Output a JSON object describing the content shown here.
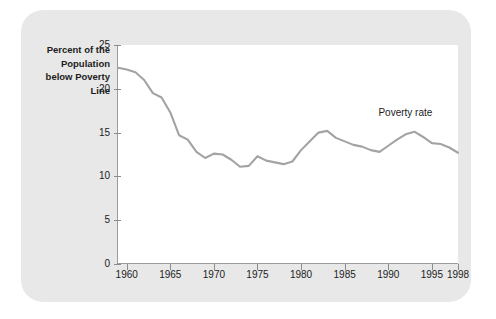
{
  "chart_data": {
    "type": "line",
    "title": "",
    "xlabel": "",
    "ylabel": "Percent of the\nPopulation\nbelow Poverty\nLine",
    "xlim": [
      1959,
      1998
    ],
    "ylim": [
      0,
      25
    ],
    "grid": false,
    "legend_position": "inline-annotation",
    "line_color": "#a3a3a3",
    "panel_color": "#ffffff",
    "card_color": "#e8e8e8",
    "yticks": [
      0,
      5,
      10,
      15,
      20,
      25
    ],
    "ytick_labels": [
      "0",
      "5",
      "10",
      "15",
      "20",
      "25"
    ],
    "xticks": [
      1960,
      1965,
      1970,
      1975,
      1980,
      1985,
      1990,
      1995,
      1998
    ],
    "xtick_labels": [
      "1960",
      "1965",
      "1970",
      "1975",
      "1980",
      "1985",
      "1990",
      "1995",
      "1998"
    ],
    "annotations": [
      {
        "text": "Poverty rate",
        "x": 1993,
        "y": 17.2
      }
    ],
    "series": [
      {
        "name": "Poverty rate",
        "x": [
          1959,
          1960,
          1961,
          1962,
          1963,
          1964,
          1965,
          1966,
          1967,
          1968,
          1969,
          1970,
          1971,
          1972,
          1973,
          1974,
          1975,
          1976,
          1977,
          1978,
          1979,
          1980,
          1981,
          1982,
          1983,
          1984,
          1985,
          1986,
          1987,
          1988,
          1989,
          1990,
          1991,
          1992,
          1993,
          1994,
          1995,
          1996,
          1997,
          1998
        ],
        "values": [
          22.4,
          22.2,
          21.9,
          21.0,
          19.5,
          19.0,
          17.3,
          14.7,
          14.2,
          12.8,
          12.1,
          12.6,
          12.5,
          11.9,
          11.1,
          11.2,
          12.3,
          11.8,
          11.6,
          11.4,
          11.7,
          13.0,
          14.0,
          15.0,
          15.2,
          14.4,
          14.0,
          13.6,
          13.4,
          13.0,
          12.8,
          13.5,
          14.2,
          14.8,
          15.1,
          14.5,
          13.8,
          13.7,
          13.3,
          12.7
        ]
      }
    ]
  }
}
